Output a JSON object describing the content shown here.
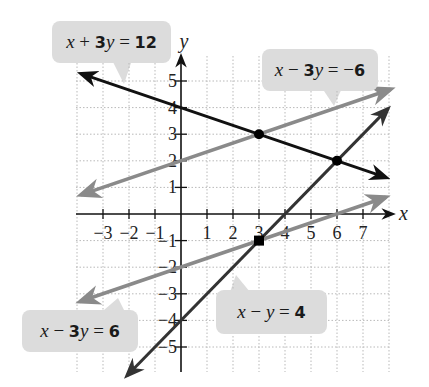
{
  "chart_data": {
    "type": "line",
    "title": "",
    "xlabel": "x",
    "ylabel": "y",
    "xlim": [
      -4,
      8
    ],
    "ylim": [
      -6,
      6
    ],
    "grid": true,
    "x_ticks": [
      -3,
      -2,
      -1,
      1,
      2,
      3,
      4,
      5,
      6,
      7
    ],
    "y_ticks": [
      -5,
      -4,
      -3,
      -2,
      -1,
      1,
      2,
      3,
      4,
      5
    ],
    "x_tick_labels": [
      "−3",
      "−2",
      "−1",
      "1",
      "2",
      "3",
      "4",
      "5",
      "6",
      "7"
    ],
    "y_tick_labels": [
      "−5",
      "−4",
      "−3",
      "−2",
      "−1",
      "1",
      "2",
      "3",
      "4",
      "5"
    ],
    "series": [
      {
        "name": "x + 3y = 12",
        "color": "#111111",
        "x": [
          -3.85,
          7.9
        ],
        "y": [
          5.28,
          1.37
        ]
      },
      {
        "name": "x − 3y = −6",
        "color": "#8a8a8a",
        "x": [
          -3.85,
          8.07
        ],
        "y": [
          0.72,
          4.69
        ]
      },
      {
        "name": "x − 3y = 6",
        "color": "#8a8a8a",
        "x": [
          -3.88,
          7.88
        ],
        "y": [
          -3.29,
          0.63
        ]
      },
      {
        "name": "x − y = 4",
        "color": "#333333",
        "x": [
          -2.08,
          7.96
        ],
        "y": [
          -6.08,
          3.96
        ]
      }
    ],
    "points": [
      {
        "x": 3,
        "y": 3,
        "marker": "circle"
      },
      {
        "x": 6,
        "y": 2,
        "marker": "circle"
      },
      {
        "x": 3,
        "y": -1,
        "marker": "square"
      }
    ]
  },
  "callouts": [
    {
      "id": "eq1",
      "parts": [
        [
          "var",
          "x"
        ],
        [
          "op",
          " + "
        ],
        [
          "num",
          "3"
        ],
        [
          "var",
          "y"
        ],
        [
          "op",
          " = "
        ],
        [
          "num",
          "12"
        ]
      ]
    },
    {
      "id": "eq2",
      "parts": [
        [
          "var",
          "x"
        ],
        [
          "op",
          " − "
        ],
        [
          "num",
          "3"
        ],
        [
          "var",
          "y"
        ],
        [
          "op",
          " = −"
        ],
        [
          "num",
          "6"
        ]
      ]
    },
    {
      "id": "eq3",
      "parts": [
        [
          "var",
          "x"
        ],
        [
          "op",
          " − "
        ],
        [
          "num",
          "3"
        ],
        [
          "var",
          "y"
        ],
        [
          "op",
          " = "
        ],
        [
          "num",
          "6"
        ]
      ]
    },
    {
      "id": "eq4",
      "parts": [
        [
          "var",
          "x"
        ],
        [
          "op",
          " − "
        ],
        [
          "var",
          "y"
        ],
        [
          "op",
          " = "
        ],
        [
          "num",
          "4"
        ]
      ]
    }
  ]
}
